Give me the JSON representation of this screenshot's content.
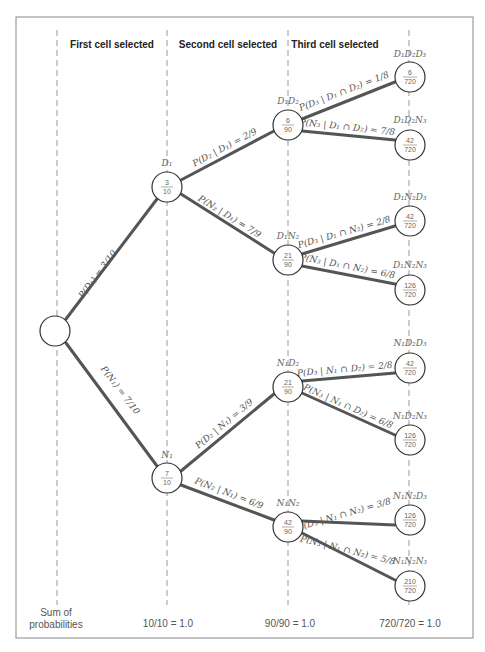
{
  "headers": {
    "first": "First cell selected",
    "second": "Second cell selected",
    "third": "Third cell selected"
  },
  "root": {
    "label": ""
  },
  "level1": [
    {
      "name": "D1",
      "label": "D₁D",
      "text": "D₁",
      "num": "3",
      "den": "10",
      "branch": "P(D₁) = 3/10"
    },
    {
      "name": "N1",
      "text": "N₁",
      "num": "7",
      "den": "10",
      "branch": "P(N₁) = 7/10"
    }
  ],
  "level2": [
    {
      "text": "D₁D₂",
      "num": "6",
      "den": "90",
      "branch": "P(D₂ | D₁) = 2/9"
    },
    {
      "text": "D₁N₂",
      "num": "21",
      "den": "90",
      "branch": "P(N₂ | D₁) = 7/9"
    },
    {
      "text": "N₁D₂",
      "num": "21",
      "den": "90",
      "branch": "P(D₂ | N₁) = 3/9"
    },
    {
      "text": "N₁N₂",
      "num": "42",
      "den": "90",
      "branch": "P(N₂ | N₁) = 6/9"
    }
  ],
  "level3": [
    {
      "text": "D₁D₂D₃",
      "num": "6",
      "den": "720",
      "branch": "P(D₃ | D₁ ∩ D₂) = 1/8"
    },
    {
      "text": "D₁D₂N₃",
      "num": "42",
      "den": "720",
      "branch": "P(N₃ | D₁ ∩ D₂) = 7/8"
    },
    {
      "text": "D₁N₂D₃",
      "num": "42",
      "den": "720",
      "branch": "P(D₃ | D₁ ∩ N₂) = 2/8"
    },
    {
      "text": "D₁N₂N₃",
      "num": "126",
      "den": "720",
      "branch": "P(N₃ | D₁ ∩ N₂) = 6/8"
    },
    {
      "text": "N₁D₂D₃",
      "num": "42",
      "den": "720",
      "branch": "P(D₃ | N₁ ∩ D₂) = 2/8"
    },
    {
      "text": "N₁D₂N₃",
      "num": "126",
      "den": "720",
      "branch": "P(N₃ | N₁ ∩ D₂) = 6/8"
    },
    {
      "text": "N₁N₂D₃",
      "num": "126",
      "den": "720",
      "branch": "P(D₃ | N₁ ∩ N₂) = 3/8"
    },
    {
      "text": "N₁N₂N₃",
      "num": "210",
      "den": "720",
      "branch": "P(N₃ | N₁ ∩ N₂) = 5/8"
    }
  ],
  "footer": {
    "label_line1": "Sum of",
    "label_line2": "probabilities",
    "sum1": "10/10 = 1.0",
    "sum2": "90/90 = 1.0",
    "sum3": "720/720 = 1.0"
  }
}
